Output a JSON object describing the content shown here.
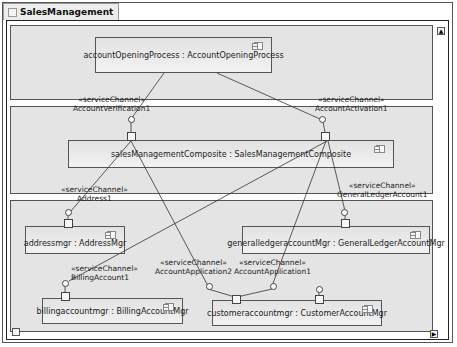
{
  "diagram": {
    "title": "SalesManagement",
    "parts": [
      {
        "id": "accountOpeningProcess",
        "label": "accountOpeningProcess : AccountOpeningProcess"
      },
      {
        "id": "salesManagementComposite",
        "label": "salesManagementComposite : SalesManagementComposite"
      },
      {
        "id": "addressmgr",
        "label": "addressmgr : AddressMgr"
      },
      {
        "id": "generalledgeraccountmgr",
        "label": "generalledgeraccountMgr : GeneralLedgerAccountMgr"
      },
      {
        "id": "billingaccountmgr",
        "label": "billingaccountmgr : BillingAccountMgr"
      },
      {
        "id": "customeraccountmgr",
        "label": "customeraccountmgr : CustomerAccountMgr"
      }
    ],
    "channels": [
      {
        "stereotype": "«serviceChannel»",
        "name": "AccountVerification1"
      },
      {
        "stereotype": "«serviceChannel»",
        "name": "AccountActivation1"
      },
      {
        "stereotype": "«serviceChannel»",
        "name": "Address1"
      },
      {
        "stereotype": "«serviceChannel»",
        "name": "GeneralLedgerAccount1"
      },
      {
        "stereotype": "«serviceChannel»",
        "name": "BillingAccount1"
      },
      {
        "stereotype": "«serviceChannel»",
        "name": "AccountApplication2"
      },
      {
        "stereotype": "«serviceChannel»",
        "name": "AccountApplication1"
      }
    ],
    "scroll": {
      "up": "▲",
      "down": "▼",
      "right": "▶"
    }
  }
}
